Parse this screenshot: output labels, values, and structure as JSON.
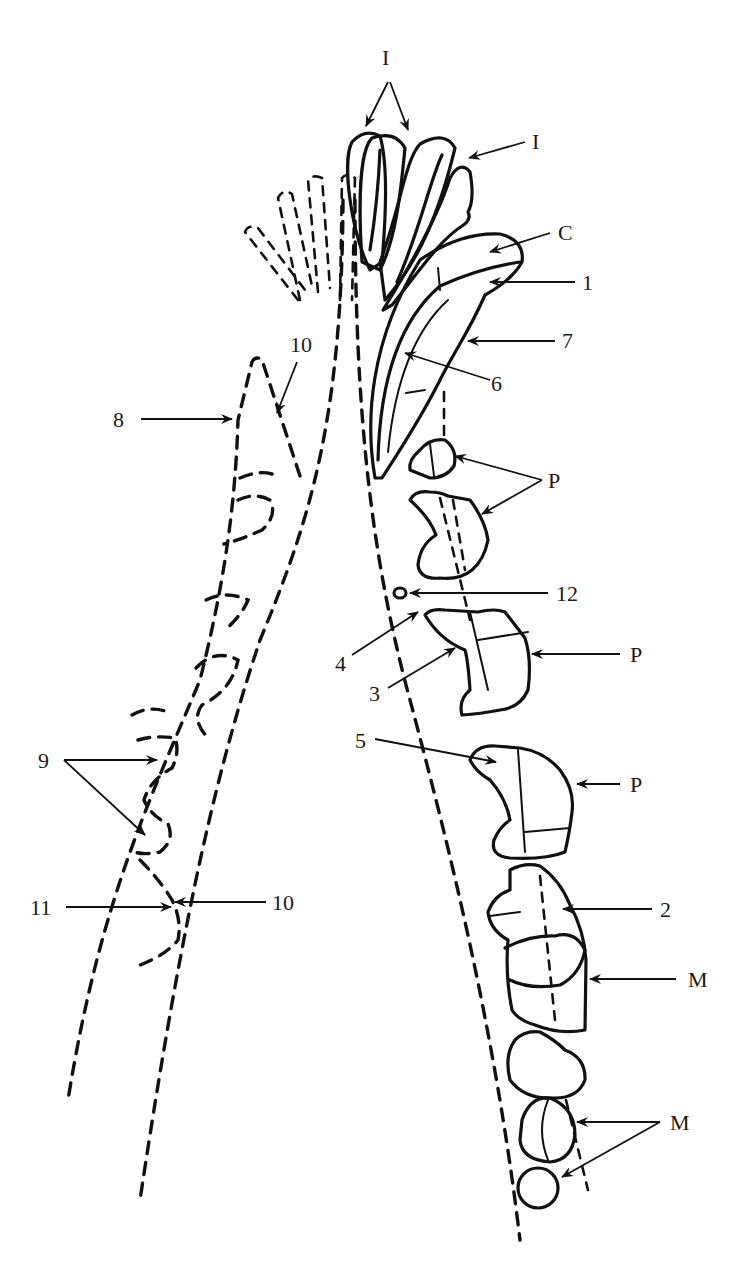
{
  "diagram": {
    "type": "dental-arcade-line-drawing",
    "colors": {
      "ink": "#111111",
      "background": "#ffffff"
    },
    "labels": {
      "incisors_top": "I",
      "incisor_third": "I",
      "canine": "C",
      "n1": "1",
      "n7": "7",
      "n6": "6",
      "premolars_upper": "P",
      "n12": "12",
      "n4": "4",
      "n3": "3",
      "premolar_3": "P",
      "n5": "5",
      "premolar_4": "P",
      "n2": "2",
      "molar_1": "M",
      "molars_2_3": "M",
      "n8": "8",
      "n10_top": "10",
      "n9": "9",
      "n11": "11",
      "n10_bottom": "10"
    }
  }
}
